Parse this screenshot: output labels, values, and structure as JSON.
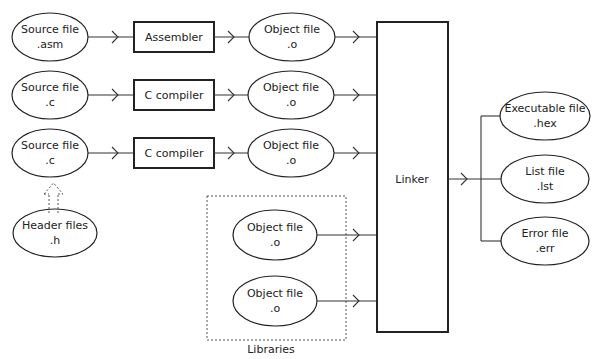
{
  "diagram": {
    "sources": [
      {
        "line1": "Source file",
        "line2": ".asm"
      },
      {
        "line1": "Source file",
        "line2": ".c"
      },
      {
        "line1": "Source file",
        "line2": ".c"
      }
    ],
    "tools": [
      "Assembler",
      "C compiler",
      "C compiler"
    ],
    "objects": [
      {
        "line1": "Object file",
        "line2": ".o"
      },
      {
        "line1": "Object file",
        "line2": ".o"
      },
      {
        "line1": "Object file",
        "line2": ".o"
      }
    ],
    "header": {
      "line1": "Header files",
      "line2": ".h"
    },
    "libraries": {
      "label": "Libraries",
      "objects": [
        {
          "line1": "Object file",
          "line2": ".o"
        },
        {
          "line1": "Object file",
          "line2": ".o"
        }
      ]
    },
    "linker": "Linker",
    "outputs": [
      {
        "line1": "Executable file",
        "line2": ".hex"
      },
      {
        "line1": "List file",
        "line2": ".lst"
      },
      {
        "line1": "Error file",
        "line2": ".err"
      }
    ]
  }
}
